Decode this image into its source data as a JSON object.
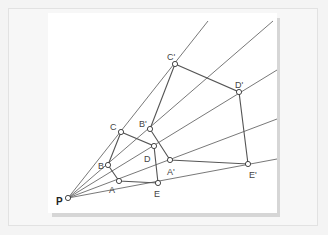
{
  "figure": {
    "center": {
      "label": "P",
      "x": 68,
      "y": 198,
      "label_x": 56,
      "label_y": 205
    },
    "original_points": [
      {
        "label": "A",
        "x": 119,
        "y": 181,
        "label_x": 109,
        "label_y": 193
      },
      {
        "label": "B",
        "x": 108,
        "y": 165,
        "label_x": 98,
        "label_y": 169
      },
      {
        "label": "C",
        "x": 121,
        "y": 132,
        "label_x": 110,
        "label_y": 130
      },
      {
        "label": "D",
        "x": 154,
        "y": 146,
        "label_x": 144,
        "label_y": 162
      },
      {
        "label": "E",
        "x": 158,
        "y": 183,
        "label_x": 154,
        "label_y": 197
      }
    ],
    "image_points": [
      {
        "label": "A'",
        "x": 170,
        "y": 160,
        "label_x": 167,
        "label_y": 175
      },
      {
        "label": "B'",
        "x": 150,
        "y": 129,
        "label_x": 139,
        "label_y": 127
      },
      {
        "label": "C'",
        "x": 175,
        "y": 64,
        "label_x": 167,
        "label_y": 60
      },
      {
        "label": "D'",
        "x": 239,
        "y": 92,
        "label_x": 235,
        "label_y": 88
      },
      {
        "label": "E'",
        "x": 248,
        "y": 164,
        "label_x": 249,
        "label_y": 178
      }
    ],
    "rays": [
      {
        "through": "C",
        "end_x": 208,
        "end_y": 21
      },
      {
        "through": "B",
        "end_x": 273,
        "end_y": 21
      },
      {
        "through": "D",
        "end_x": 277,
        "end_y": 70
      },
      {
        "through": "A",
        "end_x": 277,
        "end_y": 119
      },
      {
        "through": "E",
        "end_x": 277,
        "end_y": 159
      }
    ],
    "colors": {
      "line": "#555555",
      "point_fill": "#ffffff",
      "point_stroke": "#333333",
      "label": "#444444"
    }
  }
}
